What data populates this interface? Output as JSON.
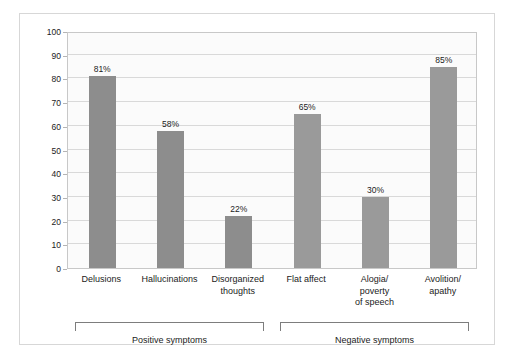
{
  "chart_data": {
    "type": "bar",
    "title": "",
    "xlabel": "",
    "ylabel": "Percentage",
    "ylim": [
      0,
      100
    ],
    "ytick_step": 10,
    "yticks": [
      100,
      90,
      80,
      70,
      60,
      50,
      40,
      30,
      20,
      10,
      0
    ],
    "grid": true,
    "legend": "none",
    "categories": [
      "Delusions",
      "Hallucinations",
      "Disorganized thoughts",
      "Flat affect",
      "Alogia/ poverty of speech",
      "Avolition/ apathy"
    ],
    "values": [
      81,
      58,
      22,
      65,
      30,
      85
    ],
    "value_labels": [
      "81%",
      "58%",
      "22%",
      "65%",
      "30%",
      "85%"
    ],
    "groups": [
      {
        "label": "Positive symptoms",
        "members": [
          "Delusions",
          "Hallucinations",
          "Disorganized thoughts"
        ]
      },
      {
        "label": "Negative symptoms",
        "members": [
          "Flat affect",
          "Alogia/ poverty of speech",
          "Avolition/ apathy"
        ]
      }
    ],
    "bar_color": "#8d8d8d",
    "bar_color_negative": "#9a9a9a",
    "grid_color": "#d9d9d9",
    "frame_color": "#c8c8c8"
  },
  "axis": {
    "y_title": "Percentage",
    "y_ticks": [
      "100",
      "90",
      "80",
      "70",
      "60",
      "50",
      "40",
      "30",
      "20",
      "10",
      "0"
    ]
  },
  "bars": [
    {
      "label_line1": "Delusions",
      "label_line2": "",
      "label_line3": "",
      "value_label": "81%",
      "value": 81
    },
    {
      "label_line1": "Hallucinations",
      "label_line2": "",
      "label_line3": "",
      "value_label": "58%",
      "value": 58
    },
    {
      "label_line1": "Disorganized",
      "label_line2": "thoughts",
      "label_line3": "",
      "value_label": "22%",
      "value": 22
    },
    {
      "label_line1": "Flat affect",
      "label_line2": "",
      "label_line3": "",
      "value_label": "65%",
      "value": 65
    },
    {
      "label_line1": "Alogia/",
      "label_line2": "poverty",
      "label_line3": "of speech",
      "value_label": "30%",
      "value": 30
    },
    {
      "label_line1": "Avolition/",
      "label_line2": "apathy",
      "label_line3": "",
      "value_label": "85%",
      "value": 85
    }
  ],
  "groups": [
    {
      "label": "Positive symptoms"
    },
    {
      "label": "Negative symptoms"
    }
  ]
}
